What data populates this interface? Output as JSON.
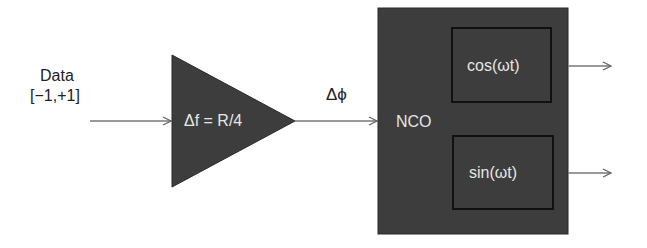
{
  "input": {
    "label_line1": "Data",
    "label_line2": "[−1,+1]"
  },
  "amplifier": {
    "label": "Δf = R/4"
  },
  "phase_label": "Δϕ",
  "nco": {
    "label": "NCO",
    "cos_block": "cos(ωt)",
    "sin_block": "sin(ωt)"
  },
  "colors": {
    "block_fill": "#3d3d3d",
    "inner_border": "#111111",
    "line": "#666666",
    "text_light": "#e6e6e6"
  }
}
